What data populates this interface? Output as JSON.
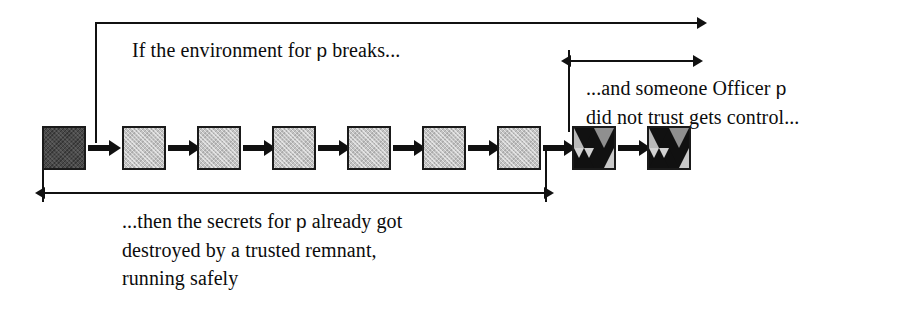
{
  "figure": {
    "background_color": "#ffffff",
    "ink_color": "#111111"
  },
  "captions": {
    "top": {
      "text_before_p": "If the environment for ",
      "p": "p",
      "text_after_p": " breaks..."
    },
    "right": {
      "line1_before_p": "...and someone Officer ",
      "p": "p",
      "line1_after_p": "",
      "line2": "did not trust gets control..."
    },
    "bottom": {
      "line1_before_p": "...then the secrets for ",
      "p": "p",
      "line1_after_p": " already got",
      "line2": "destroyed by a trusted remnant,",
      "line3": "running safely"
    }
  },
  "nodes": [
    {
      "id": "node-1",
      "kind": "dark",
      "label": "compromised-environment-node"
    },
    {
      "id": "node-2",
      "kind": "light",
      "label": "trusted-remnant-node"
    },
    {
      "id": "node-3",
      "kind": "light",
      "label": "trusted-remnant-node"
    },
    {
      "id": "node-4",
      "kind": "light",
      "label": "trusted-remnant-node"
    },
    {
      "id": "node-5",
      "kind": "light",
      "label": "trusted-remnant-node"
    },
    {
      "id": "node-6",
      "kind": "light",
      "label": "trusted-remnant-node"
    },
    {
      "id": "node-7",
      "kind": "light",
      "label": "trusted-remnant-node"
    },
    {
      "id": "node-8",
      "kind": "checker",
      "label": "untrusted-control-node"
    },
    {
      "id": "node-9",
      "kind": "checker",
      "label": "untrusted-control-node"
    }
  ],
  "annotations": [
    {
      "id": "span-environment-breaks",
      "arrowheads": "right",
      "start_x": 95,
      "end_x": 698,
      "y": 22
    },
    {
      "id": "span-someone-gets-control",
      "arrowheads": "both",
      "start_x": 568,
      "end_x": 694,
      "y": 60
    },
    {
      "id": "span-secrets-destroyed",
      "arrowheads": "both",
      "start_x": 42,
      "end_x": 545,
      "y": 192
    }
  ],
  "colors": {
    "dark_node": "#4a4a4a",
    "light_node": "#c3c3c3",
    "checker_dark": "#111111",
    "checker_light": "#c9c9c9",
    "stroke": "#111111"
  }
}
